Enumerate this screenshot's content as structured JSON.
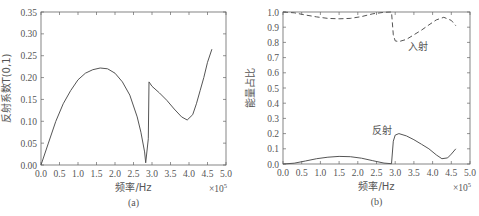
{
  "chart_data": [
    {
      "type": "line",
      "panel_label": "(a)",
      "title": "",
      "xlabel": "频率/Hz",
      "ylabel": "反射系数T(0,1)",
      "x_multiplier": "×10^5",
      "x_multiplier_base": "×10",
      "x_multiplier_exp": "5",
      "xlim": [
        0,
        5.0
      ],
      "ylim": [
        0,
        0.35
      ],
      "xticks": [
        "0.0",
        "0.5",
        "1.0",
        "1.5",
        "2.0",
        "2.5",
        "3.0",
        "3.5",
        "4.0",
        "4.5",
        "5.0"
      ],
      "yticks": [
        "0.00",
        "0.05",
        "0.10",
        "0.15",
        "0.20",
        "0.25",
        "0.30",
        "0.35"
      ],
      "grid": false,
      "series": [
        {
          "name": "反射系数",
          "style": "solid",
          "x": [
            0.0,
            0.2,
            0.4,
            0.6,
            0.8,
            1.0,
            1.2,
            1.4,
            1.6,
            1.8,
            2.0,
            2.2,
            2.4,
            2.6,
            2.7,
            2.8,
            2.83,
            2.9,
            2.92,
            3.0,
            3.2,
            3.4,
            3.6,
            3.8,
            3.95,
            4.1,
            4.2,
            4.3,
            4.4,
            4.5,
            4.62
          ],
          "y": [
            0.0,
            0.05,
            0.1,
            0.14,
            0.17,
            0.195,
            0.21,
            0.218,
            0.222,
            0.22,
            0.21,
            0.19,
            0.16,
            0.11,
            0.075,
            0.03,
            0.005,
            0.06,
            0.19,
            0.18,
            0.165,
            0.148,
            0.128,
            0.11,
            0.103,
            0.115,
            0.14,
            0.17,
            0.2,
            0.235,
            0.265
          ]
        }
      ]
    },
    {
      "type": "line",
      "panel_label": "(b)",
      "title": "",
      "xlabel": "频率/Hz",
      "ylabel": "能量占比",
      "x_multiplier": "×10^5",
      "x_multiplier_base": "×10",
      "x_multiplier_exp": "5",
      "xlim": [
        0,
        5.0
      ],
      "ylim": [
        0,
        1.0
      ],
      "xticks": [
        "0.0",
        "0.5",
        "1.0",
        "1.5",
        "2.0",
        "2.5",
        "3.0",
        "3.5",
        "4.0",
        "4.5",
        "5.0"
      ],
      "yticks": [
        "0.0",
        "0.1",
        "0.2",
        "0.3",
        "0.4",
        "0.5",
        "0.6",
        "0.7",
        "0.8",
        "0.9",
        "1.0"
      ],
      "grid": false,
      "annotations": [
        {
          "text": "入射",
          "x": 3.6,
          "y": 0.75
        },
        {
          "text": "反射",
          "x": 2.65,
          "y": 0.2
        }
      ],
      "series": [
        {
          "name": "入射",
          "style": "dashed",
          "x": [
            0.0,
            0.3,
            0.6,
            0.9,
            1.2,
            1.5,
            1.8,
            2.1,
            2.4,
            2.7,
            2.9,
            2.95,
            3.0,
            3.1,
            3.3,
            3.5,
            3.7,
            3.9,
            4.1,
            4.3,
            4.5,
            4.62
          ],
          "y": [
            1.0,
            0.995,
            0.98,
            0.968,
            0.958,
            0.955,
            0.958,
            0.97,
            0.988,
            0.998,
            1.0,
            0.85,
            0.81,
            0.805,
            0.82,
            0.85,
            0.88,
            0.915,
            0.948,
            0.965,
            0.945,
            0.91
          ]
        },
        {
          "name": "反射",
          "style": "solid",
          "x": [
            0.0,
            0.3,
            0.6,
            0.9,
            1.2,
            1.5,
            1.8,
            2.1,
            2.4,
            2.7,
            2.9,
            2.95,
            3.0,
            3.1,
            3.3,
            3.5,
            3.7,
            3.9,
            4.1,
            4.25,
            4.4,
            4.5,
            4.62
          ],
          "y": [
            0.0,
            0.005,
            0.02,
            0.035,
            0.045,
            0.05,
            0.048,
            0.038,
            0.022,
            0.006,
            0.002,
            0.15,
            0.19,
            0.2,
            0.185,
            0.16,
            0.13,
            0.1,
            0.06,
            0.035,
            0.04,
            0.065,
            0.1
          ]
        }
      ]
    }
  ]
}
